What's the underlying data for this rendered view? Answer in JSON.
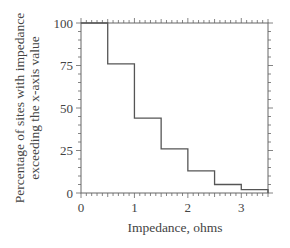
{
  "chart_data": {
    "type": "line",
    "subtype": "step",
    "title": "",
    "xlabel": "Impedance, ohms",
    "ylabel_lines": [
      "Percentage of sites with impedance",
      "exceeding the x-axis value"
    ],
    "xlim": [
      0,
      3.5
    ],
    "ylim": [
      0,
      100
    ],
    "x_ticks": [
      0,
      1,
      2,
      3
    ],
    "x_tick_labels": [
      "0",
      "1",
      "2",
      "3"
    ],
    "y_ticks": [
      0,
      25,
      50,
      75,
      100
    ],
    "y_tick_labels": [
      "0",
      "25",
      "50",
      "75",
      "100"
    ],
    "grid": false,
    "legend": null,
    "series": [
      {
        "name": "Percentage of sites exceeding impedance",
        "steps": [
          {
            "x_start": 0.0,
            "x_end": 0.5,
            "y": 100
          },
          {
            "x_start": 0.5,
            "x_end": 1.0,
            "y": 76
          },
          {
            "x_start": 1.0,
            "x_end": 1.5,
            "y": 44
          },
          {
            "x_start": 1.5,
            "x_end": 2.0,
            "y": 26
          },
          {
            "x_start": 2.0,
            "x_end": 2.5,
            "y": 13
          },
          {
            "x_start": 2.5,
            "x_end": 3.0,
            "y": 5
          },
          {
            "x_start": 3.0,
            "x_end": 3.5,
            "y": 2
          }
        ]
      }
    ],
    "colors": {
      "line": "#555555",
      "axis": "#666666"
    }
  }
}
